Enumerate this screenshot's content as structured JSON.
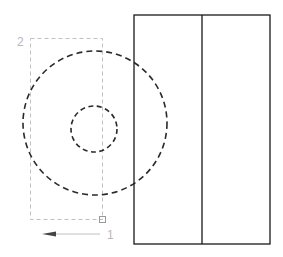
{
  "canvas": {
    "width": 283,
    "height": 257,
    "background": "#ffffff"
  },
  "labels": {
    "point_2": "2",
    "point_1": "1"
  },
  "colors": {
    "solid_stroke": "#1a1a1a",
    "dashed_circle": "#2a2a2a",
    "selection_box": "#c0c0c0",
    "label": "#b8b8b8",
    "arrow": "#555555"
  },
  "shapes": {
    "rectangle": {
      "x": 134,
      "y": 15,
      "w": 136,
      "h": 229,
      "divider_x": 202
    },
    "outer_circle": {
      "cx": 95,
      "cy": 123,
      "r": 72
    },
    "inner_circle": {
      "cx": 94,
      "cy": 129,
      "r": 23
    },
    "selection_box": {
      "x": 30,
      "y": 38,
      "w": 72,
      "h": 181
    },
    "grip": {
      "x": 99,
      "y": 216,
      "size": 6
    },
    "arrow": {
      "x1": 100,
      "y1": 234,
      "x2": 42,
      "y2": 234
    }
  }
}
